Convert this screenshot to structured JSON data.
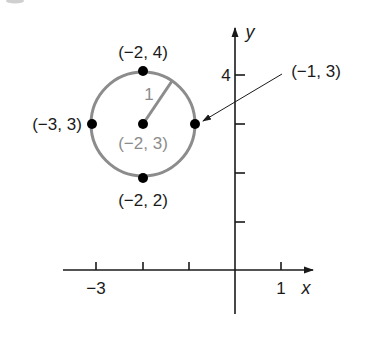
{
  "diagram": {
    "type": "coordinate-plane-circle",
    "colors": {
      "axis": "#1a1a1a",
      "circle": "#8c8c8c",
      "point": "#000000",
      "center_label": "#8c8c8c",
      "text": "#1a1a1a"
    },
    "axes": {
      "x_label": "x",
      "y_label": "y",
      "x_ticks": [
        {
          "value": -3,
          "label": "−3"
        },
        {
          "value": -2,
          "label": ""
        },
        {
          "value": -1,
          "label": ""
        },
        {
          "value": 1,
          "label": "1"
        }
      ],
      "y_ticks": [
        {
          "value": 1,
          "label": ""
        },
        {
          "value": 2,
          "label": ""
        },
        {
          "value": 3,
          "label": ""
        },
        {
          "value": 4,
          "label": "4"
        }
      ]
    },
    "circle": {
      "center": {
        "x": -2,
        "y": 3,
        "label": "(−2, 3)"
      },
      "radius": 1,
      "radius_label": "1"
    },
    "points": [
      {
        "id": "top",
        "x": -2,
        "y": 4,
        "label": "(−2, 4)"
      },
      {
        "id": "left",
        "x": -3,
        "y": 3,
        "label": "(−3, 3)"
      },
      {
        "id": "right",
        "x": -1,
        "y": 3,
        "label": "(−1, 3)"
      },
      {
        "id": "bottom",
        "x": -2,
        "y": 2,
        "label": "(−2, 2)"
      }
    ]
  }
}
